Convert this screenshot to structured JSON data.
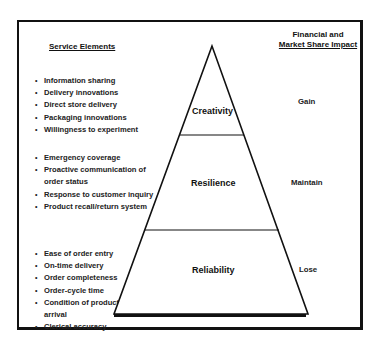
{
  "headers": {
    "left": "Service Elements",
    "right_line1": "Financial and",
    "right_line2": "Market Share Impact"
  },
  "tiers": [
    {
      "name": "Creativity",
      "impact": "Gain",
      "elements": [
        "Information sharing",
        "Delivery innovations",
        "Direct store delivery",
        "Packaging innovations",
        "Willingness to experiment"
      ]
    },
    {
      "name": "Resilience",
      "impact": "Maintain",
      "elements": [
        "Emergency coverage",
        "Proactive communication of order status",
        "Response to customer inquiry",
        "Product recall/return system"
      ]
    },
    {
      "name": "Reliability",
      "impact": "Lose",
      "elements": [
        "Ease of order entry",
        "On-time delivery",
        "Order completeness",
        "Order-cycle time",
        "Condition of product on arrival",
        "Clerical accuracy"
      ]
    }
  ],
  "colors": {
    "line": "#111111",
    "background": "#ffffff"
  }
}
